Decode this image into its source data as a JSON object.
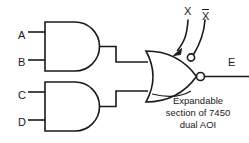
{
  "figure": {
    "stroke_color": "#1a1a1a",
    "background_color": "#ffffff"
  },
  "inputs": {
    "a_label": "A",
    "b_label": "B",
    "c_label": "C",
    "d_label": "D"
  },
  "expander_inputs": {
    "x_label": "X",
    "xbar_label": "X",
    "xbar_has_overbar": true
  },
  "output": {
    "e_label": "E"
  },
  "caption": {
    "line1": "Expandable",
    "line2": "section of 7450",
    "line3": "dual AOI"
  },
  "gates": {
    "and_gate_top": {
      "type": "AND",
      "inputs": [
        "A",
        "B"
      ]
    },
    "and_gate_bottom": {
      "type": "AND",
      "inputs": [
        "C",
        "D"
      ]
    },
    "nor_gate": {
      "type": "NOR",
      "inverted_output": true,
      "expander_bubble": true,
      "output": "E"
    }
  }
}
